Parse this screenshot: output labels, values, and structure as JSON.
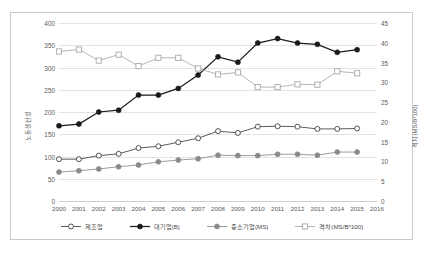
{
  "chart_data": {
    "type": "line",
    "title": "",
    "xlabel": "",
    "ylabel": "노동생산성",
    "y2label": "격차(MS/B*100)",
    "grid": true,
    "legend_position": "bottom",
    "categories": [
      "2000",
      "2001",
      "2002",
      "2003",
      "2004",
      "2005",
      "2006",
      "2007",
      "2008",
      "2009",
      "2010",
      "2011",
      "2012",
      "2013",
      "2014",
      "2015",
      "2016"
    ],
    "ylim": [
      0,
      400
    ],
    "yticks": [
      0,
      50,
      100,
      150,
      200,
      250,
      300,
      350,
      400
    ],
    "y2lim": [
      0,
      45
    ],
    "y2ticks": [
      0,
      5,
      10,
      15,
      20,
      25,
      30,
      35,
      40,
      45
    ],
    "series": [
      {
        "name": "제조업",
        "axis": "left",
        "marker": "open-circle",
        "color": "#3f3f3f",
        "values": [
          94,
          94,
          102,
          106,
          119,
          123,
          132,
          141,
          157,
          153,
          167,
          168,
          167,
          162,
          162,
          163,
          null
        ]
      },
      {
        "name": "대기업(B)",
        "axis": "left",
        "marker": "filled-circle",
        "color": "#1a1a1a",
        "values": [
          169,
          173,
          200,
          204,
          238,
          238,
          253,
          283,
          324,
          312,
          355,
          365,
          355,
          352,
          334,
          340,
          null
        ]
      },
      {
        "name": "중소기업(MS)",
        "axis": "left",
        "marker": "filled-circle-gray",
        "color": "#8a8a8a",
        "values": [
          65,
          68,
          72,
          77,
          81,
          88,
          92,
          95,
          103,
          102,
          102,
          105,
          105,
          103,
          110,
          110,
          null
        ]
      },
      {
        "name": "격차(MS/B*100)",
        "axis": "right",
        "marker": "open-square",
        "color": "#a8a8a8",
        "values": [
          37.8,
          38.3,
          35.5,
          37.0,
          34.1,
          36.2,
          36.2,
          33.5,
          32.0,
          32.5,
          28.8,
          28.8,
          29.5,
          29.4,
          32.8,
          32.3,
          null
        ]
      }
    ]
  },
  "legend": {
    "items": [
      {
        "label": "제조업",
        "marker": "open-circle"
      },
      {
        "label": "대기업(B)",
        "marker": "filled-circle"
      },
      {
        "label": "중소기업(MS)",
        "marker": "filled-circle-gray"
      },
      {
        "label": "격차(MS/B*100)",
        "marker": "open-square"
      }
    ]
  },
  "caption": ""
}
